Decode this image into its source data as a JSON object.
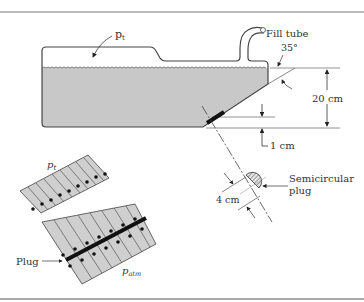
{
  "figure": {
    "labels": {
      "p_top": "p",
      "p_top_sub": "t",
      "fill_tube": "Fill tube",
      "angle": "35°",
      "depth": "20 cm",
      "offset": "1 cm",
      "plug_width": "4 cm",
      "semicircular_plug_line1": "Semicircular",
      "semicircular_plug_line2": "plug",
      "p_fbd": "p",
      "p_fbd_sub": "t",
      "plug": "Plug",
      "p_atm": "p",
      "p_atm_sub": "atm"
    },
    "colors": {
      "liquid": "#c8c8c8",
      "outline": "#444444",
      "plug": "#111111",
      "border": "#777777"
    }
  }
}
